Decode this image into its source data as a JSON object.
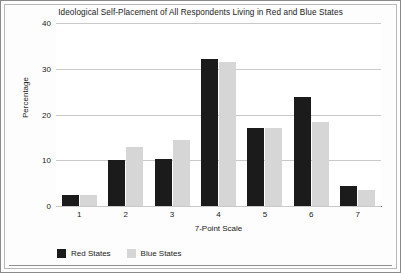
{
  "chart_data": {
    "type": "bar",
    "title": "Ideological Self-Placement of All Respondents Living in Red and Blue States",
    "xlabel": "7-Point Scale",
    "ylabel": "Percentage",
    "categories": [
      "1",
      "2",
      "3",
      "4",
      "5",
      "6",
      "7"
    ],
    "series": [
      {
        "name": "Red States",
        "color": "#1b1b1b",
        "values": [
          2.3,
          10.0,
          10.3,
          32.2,
          17.0,
          23.9,
          4.3
        ]
      },
      {
        "name": "Blue States",
        "color": "#d6d6d6",
        "values": [
          2.3,
          12.9,
          14.5,
          31.4,
          17.0,
          18.4,
          3.6
        ]
      }
    ],
    "ylim": [
      0,
      40
    ],
    "yticks": [
      0,
      10,
      20,
      30,
      40
    ],
    "ytick_labels": [
      "0",
      "10",
      "20",
      "30",
      "40"
    ],
    "grid": true,
    "legend_position": "bottom-left"
  },
  "figure": {
    "background": "#fdfdfd",
    "plot_background": "#ffffff",
    "border_color": "#8a8a8a",
    "grid_color": "#c9c9c9",
    "axis_color": "#6d6d6d"
  }
}
